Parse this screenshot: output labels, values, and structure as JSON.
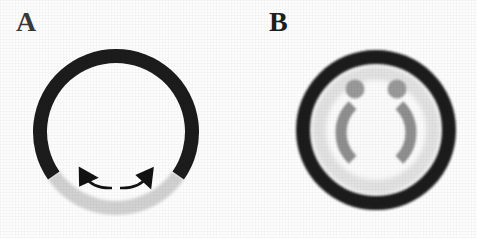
{
  "figure": {
    "width": 477,
    "height": 238,
    "background": "#fdfdfd",
    "caption_labels": {
      "panel_a": "A",
      "panel_b": "B"
    }
  },
  "colors": {
    "outer_ring_dark": "#1a1a1a",
    "arc_light_gray": "#d2d2d2",
    "inner_band_light": "#e2e2e2",
    "inner_core_white": "#fbfbfb",
    "feature_mid_gray": "#8f8f8f",
    "arrow_black": "#121212",
    "label_text": "#2a2a2a",
    "page_background": "#fdfdfd"
  },
  "panel_a": {
    "label": "A",
    "ring": {
      "center_x": 116,
      "center_y": 132,
      "outer_radius": 83,
      "thickness": 14,
      "dark_sector_start_deg": 325,
      "dark_sector_end_deg": 215,
      "light_sector_start_deg": 215,
      "light_sector_end_deg": 325,
      "dark_color": "#1a1a1a",
      "light_color": "#d2d2d2"
    },
    "arrows": {
      "count": 2,
      "color": "#121212",
      "description_left": "curved-arrow-pointing-up-left",
      "description_right": "curved-arrow-pointing-up-right",
      "left_tip_x": 85,
      "left_tip_y": 180,
      "right_tip_x": 148,
      "right_tip_y": 180
    }
  },
  "panel_b": {
    "label": "B",
    "ring": {
      "center_x": 376,
      "center_y": 130,
      "outer_radius": 80,
      "thickness": 14,
      "color": "#1a1a1a"
    },
    "inner_band": {
      "radius": 64,
      "color": "#e2e2e2"
    },
    "core": {
      "radius": 50,
      "color": "#fbfbfb"
    },
    "dots": [
      {
        "name": "left-dot",
        "cx": 355,
        "cy": 89,
        "r": 9,
        "color": "#9a9a9a"
      },
      {
        "name": "right-dot",
        "cx": 397,
        "cy": 89,
        "r": 9,
        "color": "#9a9a9a"
      }
    ],
    "bracket_arcs": [
      {
        "name": "left-bracket-arc",
        "side": "left",
        "radius": 38,
        "start_deg": 128,
        "end_deg": 232,
        "stroke_width": 11,
        "color": "#8f8f8f"
      },
      {
        "name": "right-bracket-arc",
        "side": "right",
        "radius": 38,
        "start_deg": -52,
        "end_deg": 52,
        "stroke_width": 11,
        "color": "#8f8f8f"
      }
    ]
  }
}
